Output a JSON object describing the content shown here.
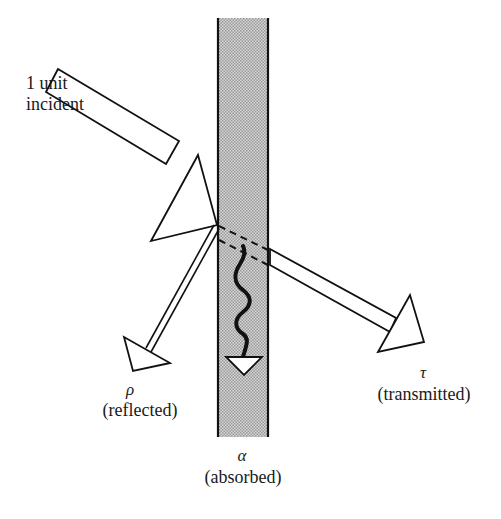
{
  "diagram": {
    "type": "radiation-slab-energy-balance",
    "colors": {
      "stroke": "#111111",
      "slab_fill": "#c8c8c8",
      "slab_dot": "#9a9a9a",
      "background": "#ffffff"
    },
    "incident": {
      "line1": "1  unit",
      "line2": "incident"
    },
    "reflected": {
      "symbol": "ρ",
      "label": "(reflected)"
    },
    "transmitted": {
      "symbol": "τ",
      "label": "(transmitted)"
    },
    "absorbed": {
      "symbol": "α",
      "label": "(absorbed)"
    }
  }
}
